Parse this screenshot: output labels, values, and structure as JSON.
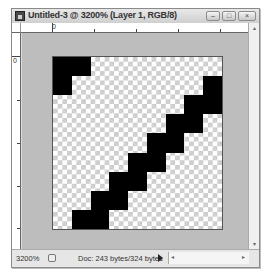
{
  "window": {
    "title": "Untitled-3 @ 3200% (Layer 1, RGB/8)",
    "icon": "photoshop-document-icon",
    "buttons": {
      "minimize": "–",
      "maximize": "□",
      "close": "×"
    }
  },
  "rulers": {
    "top_origin_label": "0",
    "left_origin_label": "0"
  },
  "canvas": {
    "width_px": 9,
    "height_px": 9,
    "foreground_color": "#000000",
    "transparency": "checkerboard",
    "pixels": [
      [
        1,
        1,
        0,
        0,
        0,
        0,
        0,
        0,
        0
      ],
      [
        1,
        0,
        0,
        0,
        0,
        0,
        0,
        0,
        1
      ],
      [
        0,
        0,
        0,
        0,
        0,
        0,
        0,
        1,
        1
      ],
      [
        0,
        0,
        0,
        0,
        0,
        0,
        1,
        1,
        0
      ],
      [
        0,
        0,
        0,
        0,
        0,
        1,
        1,
        0,
        0
      ],
      [
        0,
        0,
        0,
        0,
        1,
        1,
        0,
        0,
        0
      ],
      [
        0,
        0,
        0,
        1,
        1,
        0,
        0,
        0,
        0
      ],
      [
        0,
        0,
        1,
        1,
        0,
        0,
        0,
        0,
        0
      ],
      [
        0,
        1,
        1,
        0,
        0,
        0,
        0,
        0,
        0
      ]
    ]
  },
  "status_bar": {
    "zoom": "3200%",
    "doc_info": "Doc: 243 bytes/324 bytes",
    "menu_arrow": "▶"
  },
  "scrollbars": {
    "up": "▴",
    "down": "▾",
    "left": "◂",
    "right": "▸"
  }
}
